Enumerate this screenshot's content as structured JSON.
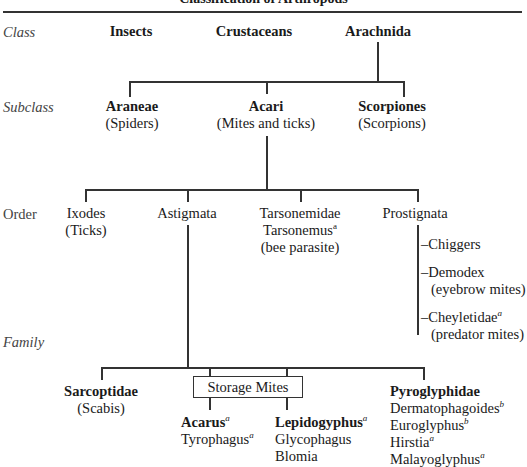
{
  "title": "Classification of Arthropods",
  "levels": {
    "class": "Class",
    "subclass": "Subclass",
    "order": "Order",
    "family": "Family"
  },
  "classes": [
    {
      "name": "Insects"
    },
    {
      "name": "Crustaceans"
    },
    {
      "name": "Arachnida"
    }
  ],
  "subclasses": [
    {
      "name": "Araneae",
      "common": "(Spiders)"
    },
    {
      "name": "Acari",
      "common": "(Mites and ticks)"
    },
    {
      "name": "Scorpiones",
      "common": "(Scorpions)"
    }
  ],
  "orders": [
    {
      "name": "Ixodes",
      "common": "(Ticks)"
    },
    {
      "name": "Astigmata"
    },
    {
      "name": "Tarsonemidae",
      "genus": "Tarsonemus",
      "genus_note": "a",
      "common": "(bee parasite)"
    },
    {
      "name": "Prostignata"
    }
  ],
  "prostignata_members": [
    {
      "name": "–Chiggers"
    },
    {
      "name": "–Demodex",
      "common": "(eyebrow mites)"
    },
    {
      "name": "–Cheyletidae",
      "note": "a",
      "common": "(predator mites)"
    }
  ],
  "families": {
    "sarcoptidae": {
      "name": "Sarcoptidae",
      "common": "(Scabis)"
    },
    "storage_mites": {
      "label": "Storage Mites",
      "left": [
        {
          "name": "Acarus",
          "note": "a",
          "bold": true
        },
        {
          "name": "Tyrophagus",
          "note": "a"
        }
      ],
      "right": [
        {
          "name": "Lepidogyphus",
          "note": "a",
          "bold": true
        },
        {
          "name": "Glycophagus"
        },
        {
          "name": "Blomia"
        }
      ]
    },
    "pyroglyphidae": {
      "name": "Pyroglyphidae",
      "members": [
        {
          "name": "Dermatophagoides",
          "note": "b"
        },
        {
          "name": "Euroglyphus",
          "note": "b"
        },
        {
          "name": "Hirstia",
          "note": "a"
        },
        {
          "name": "Malayoglyphus",
          "note": "a"
        }
      ]
    }
  }
}
